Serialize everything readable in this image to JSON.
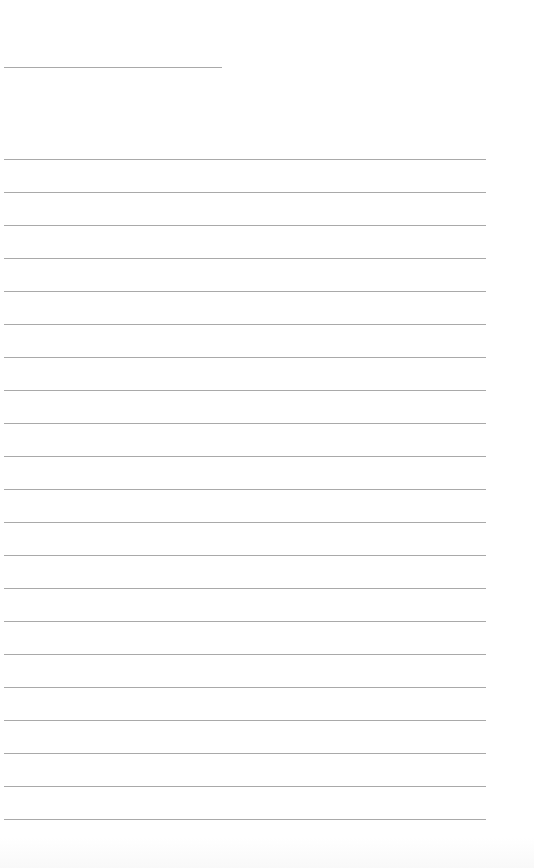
{
  "page": {
    "type": "lined-paper",
    "background_color": "#ffffff",
    "rule_color": "#9a9a9a",
    "header_rule": {
      "top": 67,
      "left": 4,
      "width": 218
    },
    "ruled_lines": {
      "left": 4,
      "width": 482,
      "first_top": 159,
      "spacing": 33,
      "count": 21
    }
  }
}
